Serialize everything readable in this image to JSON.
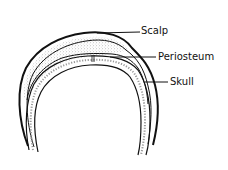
{
  "diagram": {
    "labels": [
      {
        "id": "scalp",
        "text": "Scalp"
      },
      {
        "id": "periosteum",
        "text": "Periosteum"
      },
      {
        "id": "skull",
        "text": "Skull"
      }
    ],
    "colors": {
      "line": "#111111",
      "background": "#ffffff",
      "stipple": "#9a9a9a"
    }
  }
}
